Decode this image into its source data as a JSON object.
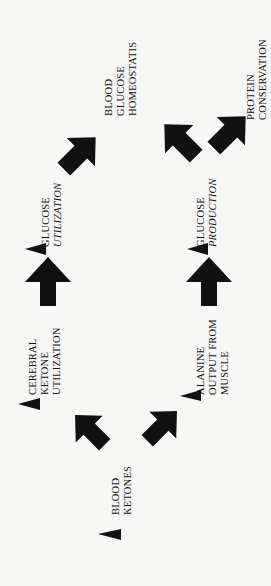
{
  "diagram": {
    "orientation": "rotated 90 degrees counter-clockwise",
    "colors": {
      "ink": "#111111",
      "background": "#f7f7f5"
    },
    "nodes": {
      "blood_ketones": {
        "lines": [
          "BLOOD",
          "KETONES"
        ]
      },
      "cerebral_ketone_utilization": {
        "lines": [
          "CEREBRAL",
          "KETONE",
          "UTILIZATION"
        ]
      },
      "alanine_output": {
        "lines": [
          "ALANINE",
          "OUTPUT FROM",
          "MUSCLE"
        ]
      },
      "glucose_utilization": {
        "lines": [
          "GLUCOSE",
          "UTILIZATION"
        ]
      },
      "glucose_production": {
        "lines": [
          "GLUCOSE",
          "PRODUCTION"
        ]
      },
      "blood_glucose_homeostatis": {
        "lines": [
          "BLOOD",
          "GLUCOSE",
          "HOMEOSTATIS"
        ]
      },
      "protein_conservation": {
        "lines": [
          "PROTEIN",
          "CONSERVATION"
        ]
      }
    },
    "edges": [
      {
        "from": "BLOOD KETONES",
        "to": "CEREBRAL KETONE UTILIZATION",
        "icon": "thick-arrow-icon"
      },
      {
        "from": "BLOOD KETONES",
        "to": "ALANINE OUTPUT FROM MUSCLE",
        "icon": "thick-arrow-icon"
      },
      {
        "from": "CEREBRAL KETONE UTILIZATION",
        "to": "GLUCOSE UTILIZATION",
        "icon": "thick-arrow-icon"
      },
      {
        "from": "ALANINE OUTPUT FROM MUSCLE",
        "to": "GLUCOSE PRODUCTION",
        "icon": "thick-arrow-icon"
      },
      {
        "from": "GLUCOSE UTILIZATION",
        "to": "BLOOD GLUCOSE HOMEOSTATIS",
        "icon": "thick-arrow-icon"
      },
      {
        "from": "GLUCOSE PRODUCTION",
        "to": "BLOOD GLUCOSE HOMEOSTATIS",
        "icon": "thick-arrow-icon"
      },
      {
        "from": "GLUCOSE PRODUCTION",
        "to": "PROTEIN CONSERVATION",
        "icon": "thick-arrow-icon"
      }
    ],
    "bullet_icon": "down-triangle-icon"
  }
}
